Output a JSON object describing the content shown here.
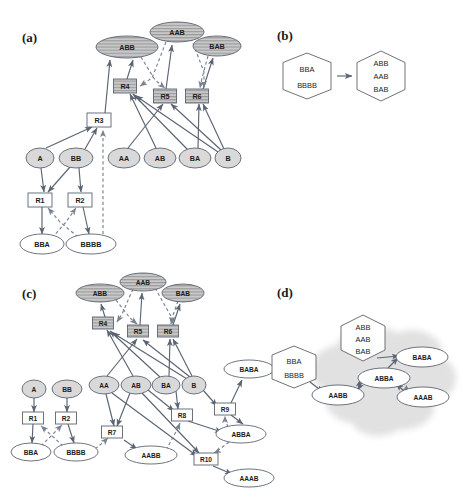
{
  "figure": {
    "panels": [
      {
        "id": "a",
        "label": "(a)"
      },
      {
        "id": "b",
        "label": "(b)"
      },
      {
        "id": "c",
        "label": "(c)"
      },
      {
        "id": "d",
        "label": "(d)"
      }
    ]
  },
  "panel_a": {
    "label": "(a)",
    "species_top": [
      {
        "name": "ABB",
        "x": 127,
        "y": 47,
        "rx": 31,
        "ry": 11,
        "style": "hatched"
      },
      {
        "name": "AAB",
        "x": 177,
        "y": 32,
        "rx": 27,
        "ry": 10,
        "style": "hatched"
      },
      {
        "name": "BAB",
        "x": 217,
        "y": 46,
        "rx": 24,
        "ry": 10,
        "style": "hatched"
      }
    ],
    "reactions_top": [
      {
        "name": "R4",
        "x": 125,
        "y": 86,
        "w": 23,
        "h": 14,
        "style": "hatched"
      },
      {
        "name": "R5",
        "x": 165,
        "y": 96,
        "w": 23,
        "h": 14,
        "style": "hatched"
      },
      {
        "name": "R6",
        "x": 197,
        "y": 96,
        "w": 23,
        "h": 14,
        "style": "hatched"
      }
    ],
    "reaction_mid": {
      "name": "R3",
      "x": 99,
      "y": 120,
      "w": 24,
      "h": 14,
      "style": "plain"
    },
    "species_mid": [
      {
        "name": "A",
        "x": 40,
        "y": 158,
        "rx": 14,
        "ry": 10
      },
      {
        "name": "BB",
        "x": 76,
        "y": 158,
        "rx": 17,
        "ry": 10
      },
      {
        "name": "AA",
        "x": 124,
        "y": 158,
        "rx": 16,
        "ry": 10
      },
      {
        "name": "AB",
        "x": 160,
        "y": 158,
        "rx": 16,
        "ry": 10
      },
      {
        "name": "BA",
        "x": 195,
        "y": 158,
        "rx": 16,
        "ry": 10
      },
      {
        "name": "B",
        "x": 228,
        "y": 158,
        "rx": 13,
        "ry": 10
      }
    ],
    "reactions_bot": [
      {
        "name": "R1",
        "x": 40,
        "y": 200,
        "w": 24,
        "h": 14,
        "style": "plain"
      },
      {
        "name": "R2",
        "x": 80,
        "y": 200,
        "w": 24,
        "h": 14,
        "style": "plain"
      }
    ],
    "species_bot": [
      {
        "name": "BBA",
        "x": 42,
        "y": 244,
        "rx": 22,
        "ry": 10,
        "style": "white"
      },
      {
        "name": "BBBB",
        "x": 91,
        "y": 244,
        "rx": 25,
        "ry": 10,
        "style": "white"
      }
    ]
  },
  "panel_b": {
    "label": "(b)",
    "hex_left": {
      "x": 307,
      "y": 76,
      "lines": [
        "BBA",
        "BBBB"
      ]
    },
    "hex_right": {
      "x": 381,
      "y": 76,
      "lines": [
        "ABB",
        "AAB",
        "BAB"
      ]
    },
    "arrow": {
      "from_x": 339,
      "to_x": 355,
      "y": 76
    }
  },
  "panel_c": {
    "label": "(c)",
    "species_top": [
      {
        "name": "ABB",
        "x": 100,
        "y": 293,
        "rx": 24,
        "ry": 9,
        "style": "hatched"
      },
      {
        "name": "AAB",
        "x": 143,
        "y": 282,
        "rx": 23,
        "ry": 9,
        "style": "hatched"
      },
      {
        "name": "BAB",
        "x": 183,
        "y": 293,
        "rx": 21,
        "ry": 9,
        "style": "hatched"
      }
    ],
    "reactions_top": [
      {
        "name": "R4",
        "x": 103,
        "y": 323,
        "w": 21,
        "h": 12,
        "style": "hatched"
      },
      {
        "name": "R5",
        "x": 138,
        "y": 331,
        "w": 21,
        "h": 12,
        "style": "hatched"
      },
      {
        "name": "R6",
        "x": 168,
        "y": 331,
        "w": 21,
        "h": 12,
        "style": "hatched"
      }
    ],
    "species_mid": [
      {
        "name": "A",
        "x": 34,
        "y": 389,
        "rx": 12,
        "ry": 9
      },
      {
        "name": "BB",
        "x": 67,
        "y": 389,
        "rx": 15,
        "ry": 9
      },
      {
        "name": "AA",
        "x": 104,
        "y": 385,
        "rx": 15,
        "ry": 9
      },
      {
        "name": "AB",
        "x": 136,
        "y": 385,
        "rx": 15,
        "ry": 9
      },
      {
        "name": "BA",
        "x": 166,
        "y": 385,
        "rx": 14,
        "ry": 9
      },
      {
        "name": "B",
        "x": 194,
        "y": 385,
        "rx": 12,
        "ry": 9
      }
    ],
    "reactions_bot": [
      {
        "name": "R1",
        "x": 33,
        "y": 418,
        "w": 21,
        "h": 12,
        "style": "plain"
      },
      {
        "name": "R2",
        "x": 66,
        "y": 418,
        "w": 21,
        "h": 12,
        "style": "plain"
      },
      {
        "name": "R7",
        "x": 112,
        "y": 432,
        "w": 21,
        "h": 12,
        "style": "plain"
      },
      {
        "name": "R8",
        "x": 182,
        "y": 415,
        "w": 21,
        "h": 12,
        "style": "plain"
      },
      {
        "name": "R9",
        "x": 225,
        "y": 409,
        "w": 21,
        "h": 12,
        "style": "plain"
      },
      {
        "name": "R10",
        "x": 206,
        "y": 459,
        "w": 24,
        "h": 12,
        "style": "plain"
      }
    ],
    "species_bot": [
      {
        "name": "BBA",
        "x": 31,
        "y": 452,
        "rx": 20,
        "ry": 9,
        "style": "white"
      },
      {
        "name": "BBBB",
        "x": 76,
        "y": 452,
        "rx": 22,
        "ry": 9,
        "style": "white"
      },
      {
        "name": "AABB",
        "x": 151,
        "y": 455,
        "rx": 26,
        "ry": 9,
        "style": "white"
      },
      {
        "name": "BABA",
        "x": 249,
        "y": 369,
        "rx": 25,
        "ry": 9,
        "style": "white"
      },
      {
        "name": "ABBA",
        "x": 241,
        "y": 434,
        "rx": 25,
        "ry": 9,
        "style": "white"
      },
      {
        "name": "AAAB",
        "x": 249,
        "y": 478,
        "rx": 25,
        "ry": 9,
        "style": "white"
      }
    ]
  },
  "panel_d": {
    "label": "(d)",
    "hex_left": {
      "x": 294,
      "y": 367,
      "lines": [
        "BBA",
        "BBBB"
      ]
    },
    "hex_top": {
      "x": 363,
      "y": 338,
      "lines": [
        "ABB",
        "AAB",
        "BAB"
      ]
    },
    "ellipses": [
      {
        "name": "BABA",
        "x": 422,
        "y": 357,
        "rx": 26,
        "ry": 10
      },
      {
        "name": "ABBA",
        "x": 384,
        "y": 378,
        "rx": 26,
        "ry": 10
      },
      {
        "name": "AABB",
        "x": 338,
        "y": 395,
        "rx": 26,
        "ry": 10
      },
      {
        "name": "AAAB",
        "x": 423,
        "y": 397,
        "rx": 26,
        "ry": 10
      }
    ],
    "cloud_fill": "#e2e2e2"
  },
  "colors": {
    "edge": "#5b6472",
    "dashed_edge": "#7a8290",
    "node_gray": "#d4d4d4",
    "node_hatched": "#c9c9c9",
    "node_white": "#ffffff",
    "text": "#1c1c1c"
  }
}
